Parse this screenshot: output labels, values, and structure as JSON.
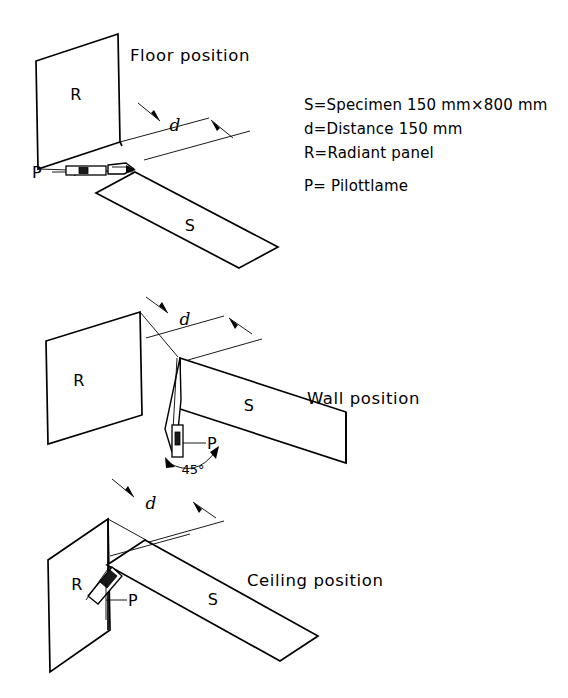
{
  "figure": {
    "background_color": "#ffffff",
    "line_color": "#000000"
  },
  "sections": [
    {
      "id": "floor",
      "title": "Floor position",
      "panel_label": "R",
      "specimen_label": "S",
      "pilot_label": "P",
      "distance_label": "d"
    },
    {
      "id": "wall",
      "title": "Wall position",
      "panel_label": "R",
      "specimen_label": "S",
      "pilot_label": "P",
      "distance_label": "d",
      "angle_label": "45°"
    },
    {
      "id": "ceiling",
      "title": "Ceiling position",
      "panel_label": "R",
      "specimen_label": "S",
      "pilot_label": "P",
      "distance_label": "d"
    }
  ],
  "legend": {
    "lines": [
      "S=Specimen 150 mm×800 mm",
      "d=Distance 150 mm",
      "R=Radiant panel",
      "P= Pilottlame"
    ]
  }
}
